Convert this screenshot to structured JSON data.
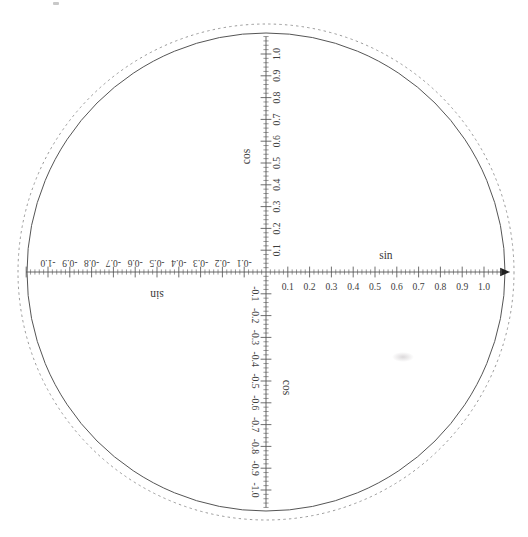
{
  "figure": {
    "type": "unit-circle-trigonometric-diagram",
    "title": "",
    "background_color": "#ffffff",
    "line_color": "#555555",
    "text_color": "#3d3d3d"
  },
  "geometry": {
    "center_x": 266,
    "center_y": 272,
    "solid_circle_radius": 239,
    "dashed_circle_radius": 248,
    "axis_unit_px": 218
  },
  "axes": {
    "horizontal": {
      "name_right": "sin",
      "name_left": "sin",
      "arrow_end": "right",
      "major_step": 0.1,
      "minor_step": 0.02,
      "range": [
        -1.1,
        1.12
      ],
      "positive_labels": [
        "0.1",
        "0.2",
        "0.3",
        "0.4",
        "0.5",
        "0.6",
        "0.7",
        "0.8",
        "0.9",
        "1.0"
      ],
      "negative_labels": [
        "-0.1",
        "-0.2",
        "-0.3",
        "-0.4",
        "-0.5",
        "-0.6",
        "-0.7",
        "-0.8",
        "-0.9",
        "-1.0"
      ],
      "positive_label_rotation_deg": 0,
      "negative_label_rotation_deg": 180
    },
    "vertical": {
      "name_top": "cos",
      "name_bottom": "cos",
      "major_step": 0.1,
      "minor_step": 0.02,
      "range": [
        -1.08,
        1.08
      ],
      "positive_labels": [
        "0.1",
        "0.2",
        "0.3",
        "0.4",
        "0.5",
        "0.6",
        "0.7",
        "0.8",
        "0.9",
        "1.0"
      ],
      "negative_labels": [
        "-0.1",
        "-0.2",
        "-0.3",
        "-0.4",
        "-0.5",
        "-0.6",
        "-0.7",
        "-0.8",
        "-0.9",
        "-1.0"
      ],
      "positive_label_rotation_deg": -90,
      "negative_label_rotation_deg": 90
    }
  },
  "chart_data": {
    "type": "scatter",
    "title": "",
    "xlabel": "sin",
    "ylabel": "cos",
    "xlim": [
      -1.1,
      1.1
    ],
    "ylim": [
      -1.1,
      1.1
    ],
    "grid": false,
    "legend": null,
    "x_ticks": [
      -1.0,
      -0.9,
      -0.8,
      -0.7,
      -0.6,
      -0.5,
      -0.4,
      -0.3,
      -0.2,
      -0.1,
      0.1,
      0.2,
      0.3,
      0.4,
      0.5,
      0.6,
      0.7,
      0.8,
      0.9,
      1.0
    ],
    "y_ticks": [
      -1.0,
      -0.9,
      -0.8,
      -0.7,
      -0.6,
      -0.5,
      -0.4,
      -0.3,
      -0.2,
      -0.1,
      0.1,
      0.2,
      0.3,
      0.4,
      0.5,
      0.6,
      0.7,
      0.8,
      0.9,
      1.0
    ],
    "x_tick_labels": [
      "-1.0",
      "-0.9",
      "-0.8",
      "-0.7",
      "-0.6",
      "-0.5",
      "-0.4",
      "-0.3",
      "-0.2",
      "-0.1",
      "0.1",
      "0.2",
      "0.3",
      "0.4",
      "0.5",
      "0.6",
      "0.7",
      "0.8",
      "0.9",
      "1.0"
    ],
    "y_tick_labels": [
      "-1.0",
      "-0.9",
      "-0.8",
      "-0.7",
      "-0.6",
      "-0.5",
      "-0.4",
      "-0.3",
      "-0.2",
      "-0.1",
      "0.1",
      "0.2",
      "0.3",
      "0.4",
      "0.5",
      "0.6",
      "0.7",
      "0.8",
      "0.9",
      "1.0"
    ],
    "series": [
      {
        "name": "unit circle (solid)",
        "shape": "circle",
        "center": [
          0,
          0
        ],
        "radius": 1.0,
        "style": "solid"
      },
      {
        "name": "outer circle (dashed)",
        "shape": "circle",
        "center": [
          0,
          0
        ],
        "radius": 1.04,
        "style": "dashed"
      }
    ]
  },
  "annotations": {
    "sin_right": "sin",
    "sin_left": "sin",
    "cos_top": "cos",
    "cos_bottom": "cos"
  }
}
